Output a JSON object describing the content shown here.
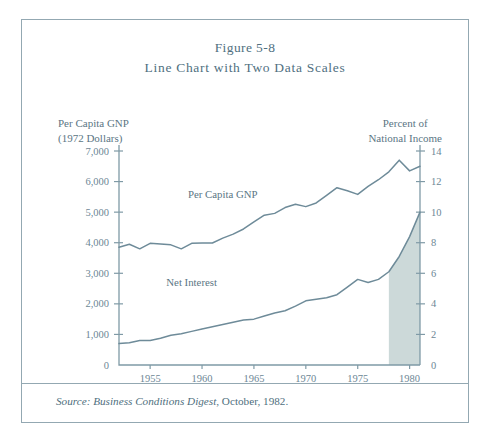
{
  "figure": {
    "title_line_1": "Figure 5-8",
    "title_line_2": "Line Chart with Two Data Scales",
    "source": {
      "label": "Source:",
      "publication": "Business Conditions Digest",
      "rest": ", October, 1982."
    }
  },
  "axes": {
    "left_caption_line_1": "Per Capita GNP",
    "left_caption_line_2": "(1972 Dollars)",
    "right_caption_line_1": "Percent of",
    "right_caption_line_2": "National Income",
    "left_ticks": [
      "7,000",
      "6,000",
      "5,000",
      "4,000",
      "3,000",
      "2,000",
      "1,000",
      "0"
    ],
    "right_ticks": [
      "14",
      "12",
      "10",
      "8",
      "6",
      "4",
      "2",
      "0"
    ],
    "x_ticks": [
      "1955",
      "1960",
      "1965",
      "1970",
      "1975",
      "1980"
    ]
  },
  "series_labels": {
    "gnp": "Per Capita GNP",
    "net_interest": "Net Interest"
  },
  "colors": {
    "line": "#6e8b99",
    "axis": "#7f9aa6",
    "text": "#5b7684",
    "shade": "#ccd9d9",
    "frame": "#93a8b2"
  },
  "chart_data": {
    "type": "line",
    "title": "Line Chart with Two Data Scales",
    "xlabel": "",
    "ylabel": "Per Capita GNP (1972 Dollars)",
    "y2label": "Percent of National Income",
    "xlim": [
      1952,
      1981
    ],
    "ylim": [
      0,
      7000
    ],
    "y2lim": [
      0,
      14
    ],
    "grid": false,
    "legend": "inline-labels",
    "x": [
      1952,
      1953,
      1954,
      1955,
      1956,
      1957,
      1958,
      1959,
      1960,
      1961,
      1962,
      1963,
      1964,
      1965,
      1966,
      1967,
      1968,
      1969,
      1970,
      1971,
      1972,
      1973,
      1974,
      1975,
      1976,
      1977,
      1978,
      1979,
      1980,
      1981
    ],
    "series": [
      {
        "name": "Per Capita GNP",
        "axis": "left",
        "unit": "1972 Dollars",
        "values": [
          3850,
          3950,
          3800,
          3980,
          3960,
          3930,
          3800,
          3980,
          3990,
          3990,
          4150,
          4280,
          4450,
          4680,
          4900,
          4960,
          5150,
          5260,
          5180,
          5300,
          5550,
          5800,
          5700,
          5580,
          5840,
          6060,
          6320,
          6700,
          6350,
          6500
        ]
      },
      {
        "name": "Net Interest",
        "axis": "right",
        "unit": "Percent of National Income",
        "values": [
          1.4,
          1.45,
          1.6,
          1.6,
          1.75,
          1.95,
          2.05,
          2.2,
          2.35,
          2.5,
          2.65,
          2.8,
          2.95,
          3.0,
          3.2,
          3.4,
          3.55,
          3.85,
          4.2,
          4.3,
          4.4,
          4.6,
          5.1,
          5.6,
          5.4,
          5.6,
          6.1,
          7.1,
          8.4,
          10.0
        ]
      }
    ],
    "annotations": [
      {
        "text": "Per Capita GNP",
        "x": 1962,
        "y": 5450,
        "axis": "left"
      },
      {
        "text": "Net Interest",
        "x": 1959,
        "y": 2600,
        "axis": "left"
      }
    ],
    "shaded_region": {
      "series": "Net Interest",
      "x_start": 1978,
      "x_end": 1981,
      "fill": "#ccd9d9",
      "description": "area under Net Interest line shaded from 1978 to 1981"
    }
  }
}
